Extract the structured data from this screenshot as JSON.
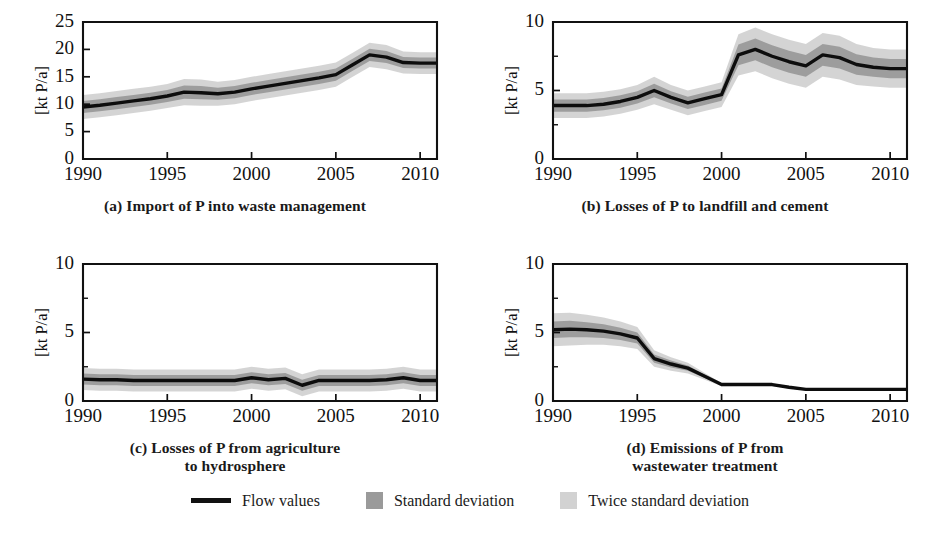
{
  "figure": {
    "ylabel": "[kt P/a]",
    "colors": {
      "flow_line": "#0d0d0d",
      "standard_deviation": "#9a9a9a",
      "twice_standard_deviation": "#d2d2d2",
      "axis": "#111111",
      "background": "#ffffff"
    }
  },
  "legend": {
    "position": "bottom-center",
    "items": [
      {
        "label": "Flow values",
        "marker": "line",
        "color": "#0d0d0d"
      },
      {
        "label": "Standard deviation",
        "marker": "swatch",
        "color": "#9a9a9a"
      },
      {
        "label": "Twice standard deviation",
        "marker": "swatch",
        "color": "#d2d2d2"
      }
    ]
  },
  "chart_data": [
    {
      "id": "a",
      "type": "line",
      "title": "(a) Import of P into waste management",
      "xlabel": "",
      "ylabel": "[kt P/a]",
      "xlim": [
        1990,
        2011
      ],
      "ylim": [
        0,
        25
      ],
      "yticks": [
        0,
        5,
        10,
        15,
        20,
        25
      ],
      "ytick_labels": [
        "0",
        "5",
        "10",
        "15",
        "20",
        "25"
      ],
      "xticks": [
        1990,
        1995,
        2000,
        2005,
        2010
      ],
      "xtick_labels": [
        "1990",
        "1995",
        "2000",
        "2005",
        "2010"
      ],
      "grid": false,
      "x": [
        1990,
        1991,
        1992,
        1993,
        1994,
        1995,
        1996,
        1997,
        1998,
        1999,
        2000,
        2001,
        2002,
        2003,
        2004,
        2005,
        2006,
        2007,
        2008,
        2009,
        2010,
        2011
      ],
      "series": [
        {
          "name": "Flow values",
          "values": [
            9.5,
            9.8,
            10.2,
            10.6,
            11.0,
            11.5,
            12.2,
            12.1,
            11.9,
            12.2,
            12.8,
            13.3,
            13.8,
            14.3,
            14.8,
            15.4,
            17.2,
            19.0,
            18.6,
            17.6,
            17.5,
            17.5
          ],
          "sd": [
            1.1,
            1.1,
            1.1,
            1.1,
            1.1,
            1.1,
            1.2,
            1.2,
            1.1,
            1.1,
            1.1,
            1.1,
            1.1,
            1.1,
            1.1,
            1.1,
            1.1,
            1.1,
            1.1,
            1.0,
            1.0,
            1.0
          ]
        }
      ]
    },
    {
      "id": "b",
      "type": "line",
      "title": "(b) Losses of P to landfill and cement",
      "xlabel": "",
      "ylabel": "[kt P/a]",
      "xlim": [
        1990,
        2011
      ],
      "ylim": [
        0,
        10
      ],
      "yticks": [
        0,
        5,
        10
      ],
      "ytick_labels": [
        "0",
        "5",
        "10"
      ],
      "yticks_minor": [
        2.5,
        7.5
      ],
      "xticks": [
        1990,
        1995,
        2000,
        2005,
        2010
      ],
      "xtick_labels": [
        "1990",
        "1995",
        "2000",
        "2005",
        "2010"
      ],
      "grid": false,
      "x": [
        1990,
        1991,
        1992,
        1993,
        1994,
        1995,
        1996,
        1997,
        1998,
        1999,
        2000,
        2001,
        2002,
        2003,
        2004,
        2005,
        2006,
        2007,
        2008,
        2009,
        2010,
        2011
      ],
      "series": [
        {
          "name": "Flow values",
          "values": [
            3.9,
            3.9,
            3.9,
            4.0,
            4.2,
            4.5,
            5.0,
            4.5,
            4.1,
            4.4,
            4.7,
            7.6,
            8.0,
            7.5,
            7.1,
            6.8,
            7.6,
            7.4,
            6.9,
            6.7,
            6.6,
            6.6
          ],
          "sd": [
            0.45,
            0.45,
            0.45,
            0.45,
            0.45,
            0.45,
            0.5,
            0.45,
            0.45,
            0.45,
            0.45,
            0.75,
            0.8,
            0.8,
            0.8,
            0.8,
            0.8,
            0.8,
            0.75,
            0.7,
            0.7,
            0.7
          ]
        }
      ]
    },
    {
      "id": "c",
      "type": "line",
      "title": "(c) Losses of P from agriculture\nto hydrosphere",
      "title_lines": [
        "(c) Losses of P from agriculture",
        "to hydrosphere"
      ],
      "xlabel": "",
      "ylabel": "[kt P/a]",
      "xlim": [
        1990,
        2011
      ],
      "ylim": [
        0,
        10
      ],
      "yticks": [
        0,
        5,
        10
      ],
      "ytick_labels": [
        "0",
        "5",
        "10"
      ],
      "yticks_minor": [
        2.5,
        7.5
      ],
      "xticks": [
        1990,
        1995,
        2000,
        2005,
        2010
      ],
      "xtick_labels": [
        "1990",
        "1995",
        "2000",
        "2005",
        "2010"
      ],
      "grid": false,
      "x": [
        1990,
        1991,
        1992,
        1993,
        1994,
        1995,
        1996,
        1997,
        1998,
        1999,
        2000,
        2001,
        2002,
        2003,
        2004,
        2005,
        2006,
        2007,
        2008,
        2009,
        2010,
        2011
      ],
      "series": [
        {
          "name": "Flow values",
          "values": [
            1.6,
            1.55,
            1.55,
            1.5,
            1.5,
            1.5,
            1.5,
            1.5,
            1.5,
            1.5,
            1.7,
            1.55,
            1.65,
            1.15,
            1.5,
            1.5,
            1.5,
            1.5,
            1.55,
            1.7,
            1.5,
            1.5
          ],
          "sd": [
            0.4,
            0.4,
            0.4,
            0.4,
            0.4,
            0.4,
            0.4,
            0.4,
            0.4,
            0.4,
            0.4,
            0.4,
            0.4,
            0.4,
            0.4,
            0.4,
            0.4,
            0.4,
            0.4,
            0.4,
            0.4,
            0.4
          ]
        }
      ]
    },
    {
      "id": "d",
      "type": "line",
      "title": "(d) Emissions of P from\nwastewater treatment",
      "title_lines": [
        "(d) Emissions of P from",
        "wastewater treatment"
      ],
      "xlabel": "",
      "ylabel": "[kt P/a]",
      "xlim": [
        1990,
        2011
      ],
      "ylim": [
        0,
        10
      ],
      "yticks": [
        0,
        5,
        10
      ],
      "ytick_labels": [
        "0",
        "5",
        "10"
      ],
      "yticks_minor": [
        2.5,
        7.5
      ],
      "xticks": [
        1990,
        1995,
        2000,
        2005,
        2010
      ],
      "xtick_labels": [
        "1990",
        "1995",
        "2000",
        "2005",
        "2010"
      ],
      "grid": false,
      "x": [
        1990,
        1991,
        1992,
        1993,
        1994,
        1995,
        1996,
        1997,
        1998,
        1999,
        2000,
        2001,
        2002,
        2003,
        2004,
        2005,
        2006,
        2007,
        2008,
        2009,
        2010,
        2011
      ],
      "series": [
        {
          "name": "Flow values",
          "values": [
            5.2,
            5.25,
            5.2,
            5.1,
            4.9,
            4.6,
            3.1,
            2.7,
            2.4,
            1.8,
            1.2,
            1.2,
            1.2,
            1.2,
            1.0,
            0.85,
            0.85,
            0.85,
            0.85,
            0.85,
            0.85,
            0.85
          ],
          "sd": [
            0.6,
            0.6,
            0.55,
            0.5,
            0.45,
            0.4,
            0.3,
            0.25,
            0.2,
            0.12,
            0.06,
            0.05,
            0.05,
            0.05,
            0.04,
            0.03,
            0.03,
            0.03,
            0.03,
            0.03,
            0.03,
            0.03
          ]
        }
      ]
    }
  ]
}
